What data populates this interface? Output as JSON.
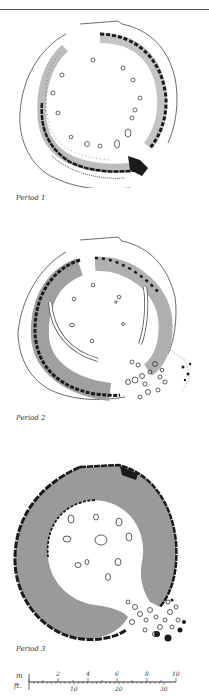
{
  "header": {
    "running_title": "· · · · · · · · · · · · ·"
  },
  "plans": [
    {
      "id": "period-1",
      "label": "Period 1"
    },
    {
      "id": "period-2",
      "label": "Period 2"
    },
    {
      "id": "period-3",
      "label": "Period 3"
    }
  ],
  "scale_bar": {
    "metric_unit": "m",
    "imperial_unit": "ft.",
    "metric_ticks": [
      "2",
      "4",
      "6",
      "8",
      "10"
    ],
    "imperial_ticks": [
      "10",
      "20",
      "30"
    ]
  },
  "colors": {
    "wall_fill": "#9a9a9a",
    "wall_dark": "#1a1a1a",
    "wall_light": "#c4c4c4",
    "outline": "#444444"
  }
}
